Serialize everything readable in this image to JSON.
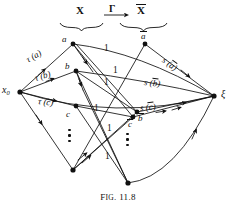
{
  "figure": {
    "caption_prefix": "F",
    "caption_rest": "IG",
    "caption_number": ". 11.8",
    "caption_full": "FIG. 11.8"
  },
  "header": {
    "source_set": "X",
    "mapping": "Γ",
    "target_set": "X",
    "target_set_overbar": true,
    "arrow_icon": "right-arrow-icon",
    "left_brace_icon": "underbrace-icon",
    "right_brace_icon": "underbrace-icon"
  },
  "endpoints": {
    "source": {
      "base": "x",
      "subscript": "0",
      "full": "x₀"
    },
    "sink": {
      "full": "ξ"
    }
  },
  "nodes": {
    "left_column": [
      {
        "id": "a",
        "label": "a"
      },
      {
        "id": "b",
        "label": "b"
      },
      {
        "id": "c",
        "label": "c"
      }
    ],
    "right_column": [
      {
        "id": "a-bar",
        "label": "a",
        "overbar": true
      },
      {
        "id": "b-bar",
        "label": "b",
        "overbar": true
      },
      {
        "id": "c-bar",
        "label": "c",
        "overbar": true
      }
    ]
  },
  "edge_labels": {
    "source_edges": [
      {
        "id": "tau-a",
        "text": "τ (a)"
      },
      {
        "id": "tau-b",
        "text": "τ (b)"
      },
      {
        "id": "tau-c",
        "text": "τ (c)"
      }
    ],
    "sink_edges": [
      {
        "id": "s-a-bar",
        "prefix": "s (",
        "letter": "a",
        "overbar": true,
        "suffix": ")"
      },
      {
        "id": "s-b-bar",
        "prefix": "s (",
        "letter": "b",
        "overbar": true,
        "suffix": ")"
      },
      {
        "id": "s-c-bar",
        "prefix": "s (",
        "letter": "c",
        "overbar": true,
        "suffix": ")"
      }
    ],
    "capacities": [
      {
        "id": "cap-1",
        "value": "1"
      },
      {
        "id": "cap-2",
        "value": "1"
      },
      {
        "id": "cap-3",
        "value": "1"
      },
      {
        "id": "cap-4",
        "value": "1"
      },
      {
        "id": "cap-5",
        "value": "1"
      },
      {
        "id": "cap-6",
        "value": "1"
      }
    ]
  },
  "ellipses": {
    "left_vertical_dots": "vertical-ellipsis-icon",
    "right_vertical_dots": "vertical-ellipsis-icon"
  }
}
